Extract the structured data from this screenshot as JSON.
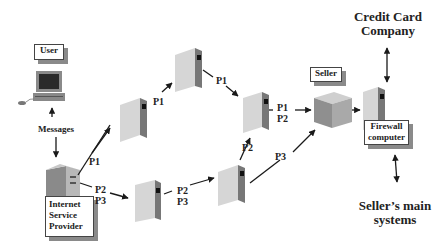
{
  "diagram": {
    "title": "",
    "labels": {
      "user": "User",
      "messages": "Messages",
      "isp": [
        "Internet",
        "Service",
        "Provider"
      ],
      "seller": "Seller",
      "firewall": [
        "Firewall",
        "computer"
      ],
      "credit_card": [
        "Credit Card",
        "Company"
      ],
      "sellers_main": [
        "Seller’s main",
        "systems"
      ]
    },
    "packets": {
      "isp_up": "P1",
      "mid_left_up": "P1",
      "top_down": "P1",
      "isp_right": [
        "P2",
        "P3"
      ],
      "bottom_mid": [
        "P2",
        "P3"
      ],
      "bottom_right_up": "P2",
      "to_seller": [
        "P1",
        "P2"
      ],
      "p3_to_seller": "P3"
    },
    "nodes": [
      {
        "id": "user",
        "type": "workstation"
      },
      {
        "id": "isp",
        "type": "server"
      },
      {
        "id": "router-mid-left",
        "type": "router"
      },
      {
        "id": "router-top",
        "type": "router"
      },
      {
        "id": "router-right",
        "type": "router"
      },
      {
        "id": "router-bottom-left",
        "type": "router"
      },
      {
        "id": "router-bottom-right",
        "type": "router"
      },
      {
        "id": "seller",
        "type": "server"
      },
      {
        "id": "firewall",
        "type": "router"
      }
    ],
    "edges": [
      {
        "from": "user",
        "to": "isp",
        "label": "Messages"
      },
      {
        "from": "isp",
        "to": "router-mid-left",
        "label": "P1"
      },
      {
        "from": "router-mid-left",
        "to": "router-top",
        "label": "P1"
      },
      {
        "from": "router-top",
        "to": "router-right",
        "label": "P1"
      },
      {
        "from": "isp",
        "to": "router-bottom-left",
        "label": "P2 P3"
      },
      {
        "from": "router-bottom-left",
        "to": "router-bottom-right",
        "label": "P2 P3"
      },
      {
        "from": "router-bottom-right",
        "to": "router-right",
        "label": "P2"
      },
      {
        "from": "router-right",
        "to": "seller",
        "label": "P1 P2"
      },
      {
        "from": "router-bottom-right",
        "to": "seller",
        "label": "P3"
      },
      {
        "from": "seller",
        "to": "firewall",
        "label": ""
      },
      {
        "from": "firewall",
        "to": "credit-card-company",
        "label": "",
        "bidirectional": true
      },
      {
        "from": "firewall",
        "to": "sellers-main-systems",
        "label": "",
        "bidirectional": true
      }
    ]
  }
}
